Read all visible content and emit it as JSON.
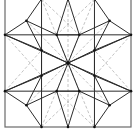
{
  "figure": {
    "colors": {
      "solid_line": "#2b2b2b",
      "frame_line": "#6a6a6a",
      "construction_line": "#c4c4c4",
      "vertex": "#111111",
      "background": "#ffffff"
    },
    "points": {
      "C": [
        0.5,
        0.5
      ],
      "T": [
        0.5,
        0.0
      ],
      "B": [
        0.5,
        1.0
      ],
      "TL": [
        0.29,
        0.0
      ],
      "TR": [
        0.71,
        0.0
      ],
      "BL": [
        0.29,
        1.0
      ],
      "BR": [
        0.71,
        1.0
      ],
      "LU": [
        0.0,
        0.28
      ],
      "LD": [
        0.0,
        0.72
      ],
      "RU": [
        1.0,
        0.28
      ],
      "RD": [
        1.0,
        0.72
      ],
      "O1": [
        0.41,
        0.28
      ],
      "O2": [
        0.59,
        0.28
      ],
      "O3": [
        0.71,
        0.4
      ],
      "O4": [
        0.71,
        0.6
      ],
      "O5": [
        0.59,
        0.72
      ],
      "O6": [
        0.41,
        0.72
      ],
      "O7": [
        0.29,
        0.6
      ],
      "O8": [
        0.29,
        0.4
      ],
      "M1": [
        0.17,
        0.17
      ],
      "M2": [
        0.83,
        0.17
      ],
      "M3": [
        0.83,
        0.83
      ],
      "M4": [
        0.17,
        0.83
      ]
    },
    "solid_segments": [
      [
        "LU",
        "RU"
      ],
      [
        "LD",
        "RD"
      ],
      [
        "TL",
        "BL"
      ],
      [
        "TR",
        "BR"
      ],
      [
        "C",
        "O1"
      ],
      [
        "C",
        "O2"
      ],
      [
        "C",
        "O3"
      ],
      [
        "C",
        "O4"
      ],
      [
        "C",
        "O5"
      ],
      [
        "C",
        "O6"
      ],
      [
        "C",
        "O7"
      ],
      [
        "C",
        "O8"
      ],
      [
        "T",
        "O1"
      ],
      [
        "T",
        "O2"
      ],
      [
        "B",
        "O5"
      ],
      [
        "B",
        "O6"
      ],
      [
        "LU",
        "O8"
      ],
      [
        "LD",
        "O7"
      ],
      [
        "RU",
        "O3"
      ],
      [
        "RD",
        "O4"
      ],
      [
        "TL",
        "M1"
      ],
      [
        "LU",
        "M1"
      ],
      [
        "M1",
        "O1"
      ],
      [
        "M1",
        "O8"
      ],
      [
        "TR",
        "M2"
      ],
      [
        "RU",
        "M2"
      ],
      [
        "M2",
        "O2"
      ],
      [
        "M2",
        "O3"
      ],
      [
        "BR",
        "M3"
      ],
      [
        "RD",
        "M3"
      ],
      [
        "M3",
        "O4"
      ],
      [
        "M3",
        "O5"
      ],
      [
        "BL",
        "M4"
      ],
      [
        "LD",
        "M4"
      ],
      [
        "M4",
        "O6"
      ],
      [
        "M4",
        "O7"
      ],
      [
        "O8",
        "O7"
      ],
      [
        "O3",
        "O4"
      ],
      [
        "O1",
        "O2"
      ],
      [
        "O6",
        "O5"
      ],
      [
        "LU",
        "C"
      ],
      [
        "RD",
        "C"
      ],
      [
        "RU",
        "C"
      ],
      [
        "LD",
        "C"
      ]
    ],
    "dashed_segments": [
      [
        "TL",
        "C"
      ],
      [
        "TR",
        "C"
      ],
      [
        "BL",
        "C"
      ],
      [
        "BR",
        "C"
      ],
      [
        "M1",
        "M3"
      ],
      [
        "M2",
        "M4"
      ],
      [
        "T",
        "B"
      ],
      [
        "LU",
        "RD"
      ],
      [
        "RU",
        "LD"
      ],
      [
        "TL",
        "O2"
      ],
      [
        "TR",
        "O1"
      ],
      [
        "BL",
        "O5"
      ],
      [
        "BR",
        "O6"
      ],
      [
        "LU",
        "O7"
      ],
      [
        "LD",
        "O8"
      ],
      [
        "RU",
        "O4"
      ],
      [
        "RD",
        "O3"
      ]
    ],
    "vertices": [
      "C",
      "LU",
      "LD",
      "RU",
      "RD",
      "BL",
      "B",
      "BR",
      "O1",
      "O2",
      "O3",
      "O4",
      "O5",
      "O6",
      "O7",
      "O8",
      "M1",
      "M2",
      "M3",
      "M4"
    ]
  }
}
